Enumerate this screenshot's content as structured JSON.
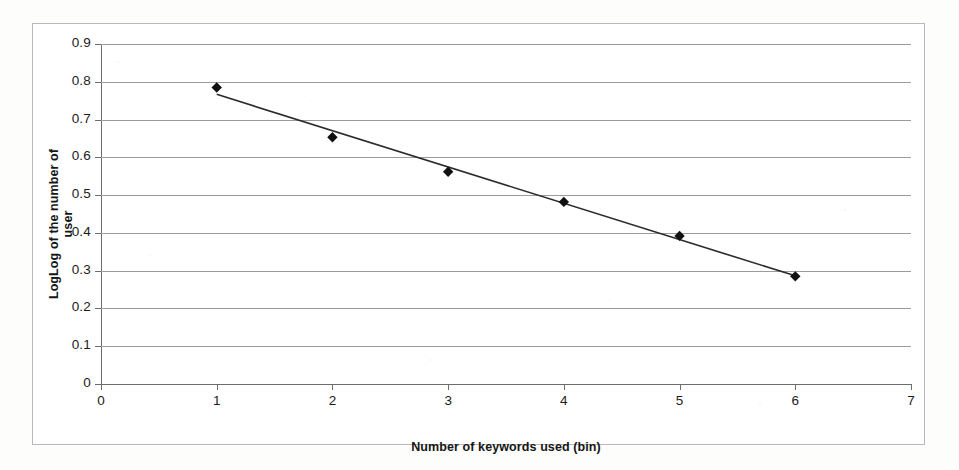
{
  "chart_data": {
    "type": "scatter",
    "title": "",
    "xlabel": "Number of keywords used (bin)",
    "ylabel": "LogLog of the number of user",
    "x": [
      1,
      2,
      3,
      4,
      5,
      6
    ],
    "values": [
      0.785,
      0.653,
      0.562,
      0.482,
      0.392,
      0.285
    ],
    "series": [
      {
        "name": "LogLog of the number of user",
        "values": [
          0.785,
          0.653,
          0.562,
          0.482,
          0.392,
          0.285
        ]
      },
      {
        "name": "linear trendline",
        "values": [
          0.79,
          0.691,
          0.592,
          0.492,
          0.393,
          0.294
        ]
      }
    ],
    "xlim": [
      0,
      7
    ],
    "ylim": [
      0,
      0.9
    ],
    "xticks": [
      "0",
      "1",
      "2",
      "3",
      "4",
      "5",
      "6",
      "7"
    ],
    "yticks": [
      "0",
      "0.1",
      "0.2",
      "0.3",
      "0.4",
      "0.5",
      "0.6",
      "0.7",
      "0.8",
      "0.9"
    ],
    "grid": "horizontal",
    "legend": "none",
    "marker": "diamond",
    "marker_color": "#111111",
    "trendline_color": "#2b2b2b",
    "gridline_color": "#9b9b9b",
    "background_color": "#ffffff"
  },
  "axes": {
    "x_title": "Number of keywords used (bin)",
    "y_title": "LogLog of the number of user",
    "x_tick_labels": [
      "0",
      "1",
      "2",
      "3",
      "4",
      "5",
      "6",
      "7"
    ],
    "y_tick_labels": [
      "0.9",
      "0.8",
      "0.7",
      "0.6",
      "0.5",
      "0.4",
      "0.3",
      "0.2",
      "0.1",
      "0"
    ]
  }
}
